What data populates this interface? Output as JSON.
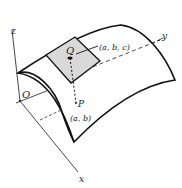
{
  "diagram": {
    "type": "3d-surface-illustration",
    "axes": {
      "x_label": "x",
      "y_label": "y",
      "z_label": "z",
      "origin_label": "O"
    },
    "points": {
      "Q": {
        "label": "Q",
        "coords_label": "(a, b, c)"
      },
      "P": {
        "label": "P",
        "coords_label": "(a, b)"
      }
    },
    "colors": {
      "line": "#1a1a1a",
      "patch_fill": "#d9d9d9",
      "background": "#ffffff"
    }
  }
}
